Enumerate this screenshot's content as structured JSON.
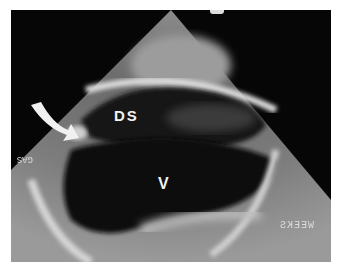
{
  "image": {
    "type": "echocardiogram / ultrasound sector scan",
    "labels": {
      "ds": "DS",
      "v": "V"
    },
    "overlay_text": {
      "left_edge": "GAS",
      "right_edge": "WEEKS"
    },
    "annotations": [
      {
        "kind": "arrow",
        "color": "#f0f0f0",
        "direction": "down-right",
        "pointing_to": "structure left of DS"
      }
    ],
    "colors": {
      "background": "#060606",
      "margin": "#ffffff",
      "tissue_bright": "#d8d8d8"
    }
  }
}
